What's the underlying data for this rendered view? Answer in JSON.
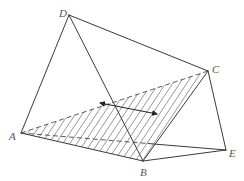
{
  "figure": {
    "type": "solid-geometry-diagram",
    "vertices": {
      "A": {
        "label": "A",
        "x": 21,
        "y": 133,
        "label_x": 9,
        "label_y": 140
      },
      "B": {
        "label": "B",
        "x": 143,
        "y": 161,
        "label_x": 140,
        "label_y": 176
      },
      "C": {
        "label": "C",
        "x": 208,
        "y": 71,
        "label_x": 212,
        "label_y": 73
      },
      "D": {
        "label": "D",
        "x": 69,
        "y": 15,
        "label_x": 59,
        "label_y": 17
      },
      "E": {
        "label": "E",
        "x": 226,
        "y": 150,
        "label_x": 229,
        "label_y": 157
      }
    },
    "solid_edges": [
      [
        "D",
        "A"
      ],
      [
        "D",
        "B"
      ],
      [
        "D",
        "C"
      ],
      [
        "A",
        "B"
      ],
      [
        "B",
        "C"
      ],
      [
        "B",
        "E"
      ],
      [
        "C",
        "E"
      ]
    ],
    "dashed_edges": [
      [
        "A",
        "C"
      ]
    ],
    "partially_hidden_edges": [
      {
        "from": "A",
        "to": "E",
        "dashed_until_fraction": 0.62
      }
    ],
    "shaded_face": [
      "A",
      "B",
      "C"
    ],
    "arrow": {
      "x1": 100,
      "y1": 103,
      "x2": 157,
      "y2": 114,
      "heads": "both"
    },
    "colors": {
      "line": "#3a3a3a",
      "hatch": "#6a6a6a",
      "label": "#555555",
      "background": "#ffffff"
    }
  }
}
